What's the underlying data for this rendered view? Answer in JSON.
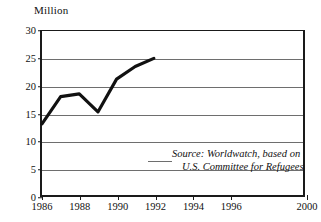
{
  "chart_data": {
    "type": "line",
    "title": "",
    "subtitle": "",
    "ylabel": "Million",
    "xlabel": "",
    "ylim": [
      0,
      30
    ],
    "xlim": [
      1986,
      2000
    ],
    "yticks": [
      0,
      5,
      10,
      15,
      20,
      25,
      30
    ],
    "ytick_labels": [
      "0",
      "5",
      "10",
      "15",
      "20",
      "25",
      "30"
    ],
    "xticks": [
      1986,
      1988,
      1990,
      1992,
      1994,
      1996,
      2000
    ],
    "xtick_labels": [
      "1986",
      "1988",
      "1990",
      "1992",
      "1994",
      "1996",
      "2000"
    ],
    "grid": "horizontal",
    "legend": "none",
    "x": [
      1986,
      1987,
      1988,
      1989,
      1990,
      1991,
      1992
    ],
    "values": [
      13.0,
      18.0,
      18.5,
      15.2,
      21.2,
      23.5,
      25.0
    ],
    "series": [
      {
        "name": "Refugees",
        "values": [
          13.0,
          18.0,
          18.5,
          15.2,
          21.2,
          23.5,
          25.0
        ]
      }
    ],
    "annotations": [
      "Source: Worldwatch, based on",
      "U.S. Committee for Refugees"
    ],
    "line_color": "#111111",
    "grid_color": "#6e6e6e",
    "axis_color": "#1a1a1a"
  },
  "axis": {
    "y_unit_label": "Million"
  },
  "source": {
    "line1": "Source: Worldwatch, based on",
    "line2": "U.S. Committee for Refugees"
  }
}
